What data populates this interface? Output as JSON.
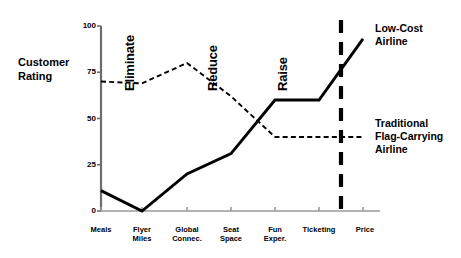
{
  "chart_data": {
    "type": "line",
    "title": "",
    "xlabel": "",
    "ylabel": "Customer\nRating",
    "ylim": [
      0,
      100
    ],
    "yticks": [
      0,
      25,
      50,
      75,
      100
    ],
    "ytick_labels": [
      "0",
      "25",
      "50",
      "75",
      "100"
    ],
    "grid": false,
    "legend_position": "right-inline-callouts",
    "categories": [
      "Meals",
      "Flyer\nMiles",
      "Global\nConnec.",
      "Seat\nSpace",
      "Fun\nExper.",
      "Ticketing",
      "Price"
    ],
    "series": [
      {
        "name": "Low-Cost\nAirline",
        "style": "solid",
        "color": "#000000",
        "values": [
          11,
          0,
          20,
          31,
          60,
          60,
          93
        ]
      },
      {
        "name": "Traditional\nFlag-Carrying\nAirline",
        "style": "dashed",
        "color": "#000000",
        "values": [
          70,
          69,
          80,
          62,
          40,
          40,
          40
        ]
      }
    ],
    "annotations": [
      {
        "text": "Eliminate",
        "orientation": "vertical",
        "x_category": "Flyer Miles"
      },
      {
        "text": "Reduce",
        "orientation": "vertical",
        "x_category": "Seat Space"
      },
      {
        "text": "Raise",
        "orientation": "vertical",
        "x_category": "Fun Exper."
      }
    ],
    "divider": {
      "name": "price-divider",
      "style": "thick-dashed",
      "orientation": "vertical",
      "between": [
        "Ticketing",
        "Price"
      ]
    }
  },
  "geometry": {
    "plot_left": 101,
    "plot_right": 380,
    "plot_top": 26,
    "plot_bottom": 211,
    "category_x": [
      101,
      142,
      187,
      231,
      275,
      319,
      363
    ],
    "divider_x": 341
  }
}
